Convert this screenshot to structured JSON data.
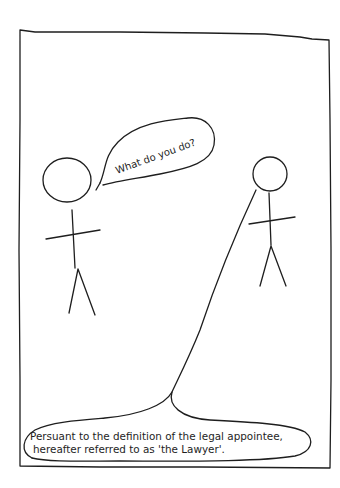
{
  "comic": {
    "panel_count": 1,
    "background": "#ffffff",
    "ink_color": "#1e1e1e",
    "characters": [
      {
        "id": "left-stick-figure",
        "role": "questioner"
      },
      {
        "id": "right-stick-figure",
        "role": "answerer"
      }
    ],
    "speech": {
      "question": "What do you do?",
      "answer_line1": "Persuant to the definition of the legal appointee,",
      "answer_line2": "hereafter referred to as 'the Lawyer'."
    }
  }
}
